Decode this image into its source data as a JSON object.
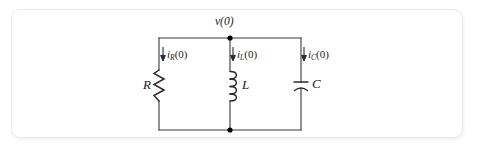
{
  "figure": {
    "kind": "electrical-circuit-schematic",
    "card": {
      "background": "#ffffff",
      "border_color": "#e8e8e8",
      "corner_radius_px": 9
    },
    "ink_color": "#333333",
    "node_color": "#000000"
  },
  "labels": {
    "node_voltage": "v(0)",
    "resistor": "R",
    "inductor": "L",
    "capacitor": "C"
  },
  "currents": [
    {
      "id": "iR",
      "symbol": "i",
      "subscript": "R",
      "argument": "(0)",
      "text": "i_R(0)",
      "direction": "down"
    },
    {
      "id": "iL",
      "symbol": "i",
      "subscript": "L",
      "argument": "(0)",
      "text": "i_L(0)",
      "direction": "down"
    },
    {
      "id": "iC",
      "symbol": "i",
      "subscript": "C",
      "argument": "(0)",
      "text": "i_C(0)",
      "direction": "down"
    }
  ],
  "geometry": {
    "top_rail_y": 38,
    "bottom_rail_y": 130,
    "left_branch_x": 159,
    "middle_branch_x": 230,
    "right_branch_x": 301,
    "node_top": {
      "x": 230,
      "y": 38
    },
    "node_bottom": {
      "x": 230,
      "y": 130
    }
  },
  "components": [
    {
      "type": "resistor",
      "label": "R",
      "branch": "left",
      "style": "zigzag",
      "zigs": 6
    },
    {
      "type": "inductor",
      "label": "L",
      "branch": "middle",
      "style": "coil",
      "loops": 4
    },
    {
      "type": "capacitor",
      "label": "C",
      "branch": "right",
      "style": "curved-plate"
    }
  ]
}
